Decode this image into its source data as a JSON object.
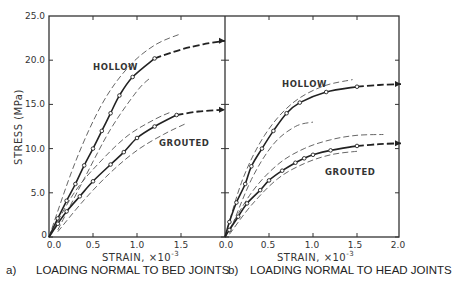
{
  "chart_data": [
    {
      "type": "line",
      "panel": "a",
      "title": "",
      "caption": "LOADING NORMAL TO BED JOINTS",
      "xlabel": "STRAIN, ×10⁻³",
      "ylabel": "STRESS (MPa)",
      "xlim": [
        0.0,
        2.0
      ],
      "ylim": [
        0.0,
        25.0
      ],
      "xticks": [
        "0.0",
        "0.5",
        "1.0",
        "1.5"
      ],
      "yticks": [
        "0",
        "5.0",
        "10.0",
        "15.0",
        "20.0",
        "25.0"
      ],
      "grid": false,
      "series": [
        {
          "name": "HOLLOW",
          "points": [
            [
              0,
              0
            ],
            [
              0.1,
              2.1
            ],
            [
              0.2,
              4.1
            ],
            [
              0.3,
              6.0
            ],
            [
              0.4,
              8.1
            ],
            [
              0.5,
              10.0
            ],
            [
              0.6,
              12.0
            ],
            [
              0.7,
              14.0
            ],
            [
              0.8,
              16.0
            ],
            [
              0.95,
              18.1
            ],
            [
              1.2,
              20.2
            ]
          ],
          "extrapolated": [
            [
              1.2,
              20.2
            ],
            [
              1.5,
              21.2
            ],
            [
              1.75,
              21.8
            ],
            [
              2.0,
              22.2
            ]
          ],
          "upper_bound": [
            [
              0,
              0
            ],
            [
              0.3,
              8.5
            ],
            [
              0.6,
              15
            ],
            [
              0.9,
              19.2
            ],
            [
              1.2,
              21.7
            ],
            [
              1.5,
              23.0
            ]
          ],
          "lower_bound": [
            [
              0.1,
              0.8
            ],
            [
              0.4,
              6.6
            ],
            [
              0.7,
              12.2
            ],
            [
              1.0,
              16.5
            ],
            [
              1.15,
              18.0
            ]
          ]
        },
        {
          "name": "GROUTED",
          "points": [
            [
              0,
              0
            ],
            [
              0.1,
              1.5
            ],
            [
              0.2,
              2.9
            ],
            [
              0.35,
              4.6
            ],
            [
              0.5,
              6.3
            ],
            [
              0.7,
              8.2
            ],
            [
              0.85,
              9.6
            ],
            [
              1.0,
              11.2
            ],
            [
              1.2,
              12.5
            ],
            [
              1.45,
              13.8
            ]
          ],
          "extrapolated": [
            [
              1.45,
              13.8
            ],
            [
              1.7,
              14.2
            ],
            [
              2.0,
              14.4
            ]
          ],
          "upper_bound": [
            [
              0,
              0
            ],
            [
              0.3,
              5.2
            ],
            [
              0.6,
              8.7
            ],
            [
              0.9,
              11.5
            ],
            [
              1.2,
              13.3
            ],
            [
              1.4,
              14.2
            ]
          ],
          "lower_bound": [
            [
              0.1,
              0.6
            ],
            [
              0.4,
              4.2
            ],
            [
              0.7,
              7.3
            ],
            [
              1.0,
              9.8
            ],
            [
              1.3,
              11.6
            ],
            [
              1.55,
              12.8
            ]
          ]
        }
      ]
    },
    {
      "type": "line",
      "panel": "b",
      "title": "",
      "caption": "LOADING NORMAL TO HEAD JOINTS",
      "xlabel": "STRAIN, ×10⁻³",
      "ylabel": "STRESS (MPa)",
      "xlim": [
        0.0,
        2.0
      ],
      "ylim": [
        0.0,
        25.0
      ],
      "xticks": [
        "0.0",
        "0.5",
        "1.0",
        "1.5",
        "2.0"
      ],
      "grid": false,
      "series": [
        {
          "name": "HOLLOW",
          "points": [
            [
              0,
              0
            ],
            [
              0.05,
              1.7
            ],
            [
              0.13,
              3.9
            ],
            [
              0.23,
              6.0
            ],
            [
              0.3,
              8.0
            ],
            [
              0.42,
              10.0
            ],
            [
              0.55,
              12.0
            ],
            [
              0.7,
              14.0
            ],
            [
              0.85,
              15.2
            ],
            [
              1.15,
              16.4
            ],
            [
              1.5,
              17.0
            ]
          ],
          "extrapolated": [
            [
              1.5,
              17.0
            ],
            [
              1.75,
              17.2
            ],
            [
              2.0,
              17.3
            ]
          ],
          "upper_bound": [
            [
              0,
              0
            ],
            [
              0.2,
              6.5
            ],
            [
              0.45,
              11.5
            ],
            [
              0.75,
              15.0
            ],
            [
              1.1,
              17.0
            ],
            [
              1.45,
              17.8
            ]
          ],
          "lower_bound": [
            [
              0.05,
              0.5
            ],
            [
              0.3,
              6.5
            ],
            [
              0.55,
              10.5
            ],
            [
              0.8,
              12.5
            ],
            [
              1.0,
              13.0
            ]
          ]
        },
        {
          "name": "GROUTED",
          "points": [
            [
              0,
              0
            ],
            [
              0.05,
              0.8
            ],
            [
              0.15,
              2.3
            ],
            [
              0.25,
              3.8
            ],
            [
              0.4,
              5.3
            ],
            [
              0.5,
              6.4
            ],
            [
              0.65,
              7.5
            ],
            [
              0.8,
              8.4
            ],
            [
              0.9,
              8.9
            ],
            [
              1.0,
              9.3
            ],
            [
              1.2,
              9.8
            ],
            [
              1.5,
              10.3
            ]
          ],
          "extrapolated": [
            [
              1.5,
              10.3
            ],
            [
              1.75,
              10.5
            ],
            [
              2.0,
              10.6
            ]
          ],
          "upper_bound": [
            [
              0,
              0
            ],
            [
              0.3,
              5.0
            ],
            [
              0.6,
              8.2
            ],
            [
              0.9,
              10.0
            ],
            [
              1.2,
              11.0
            ],
            [
              1.5,
              11.5
            ],
            [
              1.8,
              11.6
            ]
          ],
          "lower_bound": [
            [
              0.05,
              0.3
            ],
            [
              0.3,
              3.6
            ],
            [
              0.6,
              6.6
            ],
            [
              0.9,
              8.3
            ],
            [
              1.2,
              9.3
            ],
            [
              1.5,
              9.7
            ]
          ]
        }
      ]
    }
  ],
  "axes": {
    "ylabel": "STRESS (MPa)",
    "left_xlabel": "STRAIN, ×10",
    "right_xlabel": "STRAIN, ×10",
    "exponent": "-3",
    "yticks": [
      "25.0",
      "20.0",
      "15.0",
      "10.0",
      "5.0",
      "0"
    ],
    "left_xticks": [
      "0.0",
      "0.5",
      "1.0",
      "1.5"
    ],
    "right_xticks": [
      "0.0",
      "0.5",
      "1.0",
      "1.5",
      "2.0"
    ]
  },
  "annotations": {
    "left_hollow": "HOLLOW",
    "left_grouted": "GROUTED",
    "right_hollow": "HOLLOW",
    "right_grouted": "GROUTED"
  },
  "captions": {
    "a_label": "a)",
    "a_text": "LOADING NORMAL TO BED JOINTS",
    "b_label": "b)",
    "b_text": "LOADING NORMAL TO HEAD JOINTS"
  }
}
